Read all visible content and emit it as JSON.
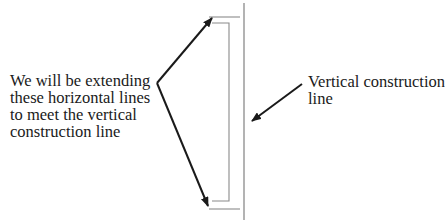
{
  "diagram": {
    "left_annotation": {
      "lines": [
        "We will be extending",
        "these horizontal lines",
        "to meet the vertical",
        "construction line"
      ]
    },
    "right_annotation": {
      "lines": [
        "Vertical construction",
        "line"
      ]
    },
    "colors": {
      "background": "#ffffff",
      "construction_line": "#8a8a8a",
      "arrow": "#1a1a1a",
      "text": "#1a1a1a"
    }
  }
}
